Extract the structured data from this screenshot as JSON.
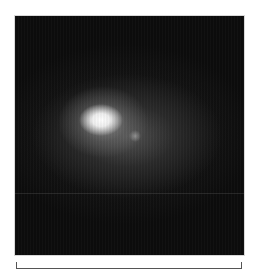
{
  "image": {
    "description": "Grayscale astronomical image of a diffuse glowing object with a bright core and a faint secondary knot",
    "background_color": "#0c0c0c",
    "core_color": "#ffffff"
  },
  "scale_bar": {
    "label": null
  }
}
